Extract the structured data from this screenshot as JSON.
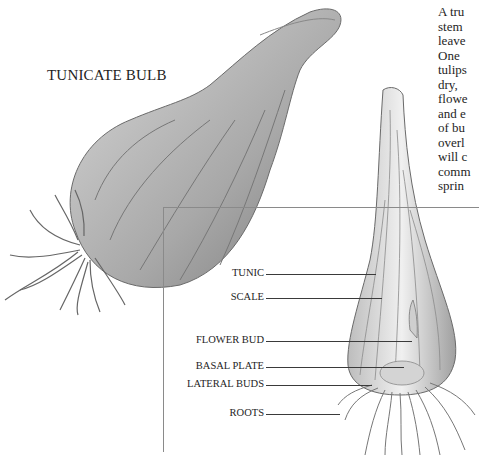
{
  "figure": {
    "title": "TUNICATE BULB",
    "body_text_lines": [
      "A tru",
      "stem",
      "leave",
      "One",
      "tulips",
      "dry,",
      "flowe",
      "and e",
      "of bu",
      "overl",
      "will c",
      "comm",
      "sprin"
    ],
    "labels": [
      {
        "text": "TUNIC",
        "y": 274
      },
      {
        "text": "SCALE",
        "y": 298
      },
      {
        "text": "FLOWER BUD",
        "y": 341
      },
      {
        "text": "BASAL PLATE",
        "y": 367
      },
      {
        "text": "LATERAL BUDS",
        "y": 385
      },
      {
        "text": "ROOTS",
        "y": 414
      }
    ],
    "colors": {
      "ink": "#1e1e1e",
      "rule": "#8a8a8a",
      "bulb_shade": "#9a9a9a"
    }
  }
}
